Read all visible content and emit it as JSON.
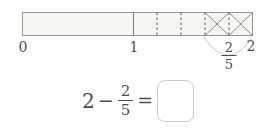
{
  "diagram": {
    "type": "fraction-bar-model",
    "range": [
      0,
      2
    ],
    "second_unit_divisions": 5,
    "crossed_out_fifths": 2,
    "axis_labels": {
      "start": "0",
      "middle": "1",
      "end": "2"
    },
    "brace_label": {
      "numerator": "2",
      "denominator": "5"
    },
    "colors": {
      "bar_fill": "#f6f5f1",
      "bar_outline": "#99999a",
      "unit_line": "#777777",
      "dashed_line": "#5a5a5a",
      "cross_mark": "#8c8c8c",
      "brace_arc": "#d2d2ce",
      "text": "#4d4d4d",
      "answer_box_border": "#cccccc"
    }
  },
  "equation": {
    "minuend": "2",
    "operator": "−",
    "subtrahend": {
      "numerator": "2",
      "denominator": "5"
    },
    "equals_sign": "=",
    "answer": ""
  }
}
